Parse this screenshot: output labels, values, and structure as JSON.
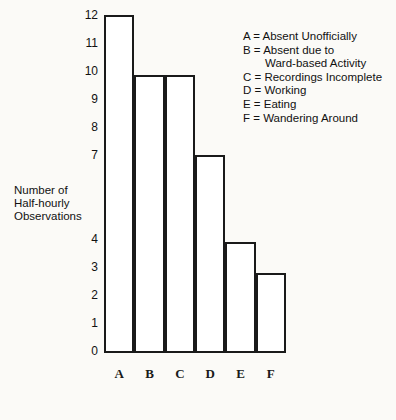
{
  "chart_data": {
    "type": "bar",
    "title": "",
    "subtitle": "",
    "xlabel": "",
    "ylabel": "Number of Half-hourly Observations",
    "categories": [
      "A",
      "B",
      "C",
      "D",
      "E",
      "F"
    ],
    "values": [
      12,
      9.85,
      9.85,
      7,
      3.9,
      2.8
    ],
    "ylim": [
      0,
      12
    ],
    "yticks": [
      0,
      1,
      2,
      3,
      4,
      7,
      8,
      9,
      10,
      11,
      12
    ],
    "ytick_labels": [
      "0",
      "1",
      "2",
      "3",
      "4",
      "7",
      "8",
      "9",
      "10",
      "11",
      "12"
    ],
    "grid": false,
    "legend_position": "top-right",
    "legend": [
      {
        "key": "A",
        "label": "Absent Unofficially"
      },
      {
        "key": "B",
        "label": "Absent due to",
        "continuation": "Ward-based Activity"
      },
      {
        "key": "C",
        "label": "Recordings Incomplete"
      },
      {
        "key": "D",
        "label": "Working"
      },
      {
        "key": "E",
        "label": "Eating"
      },
      {
        "key": "F",
        "label": "Wandering Around"
      }
    ],
    "bar_color": "#ffffff",
    "line_color": "#1a1a1a",
    "background_color": "#fbfaf7"
  },
  "axis_title": {
    "line1": "Number of",
    "line2": "Half-hourly",
    "line3": "Observations"
  }
}
